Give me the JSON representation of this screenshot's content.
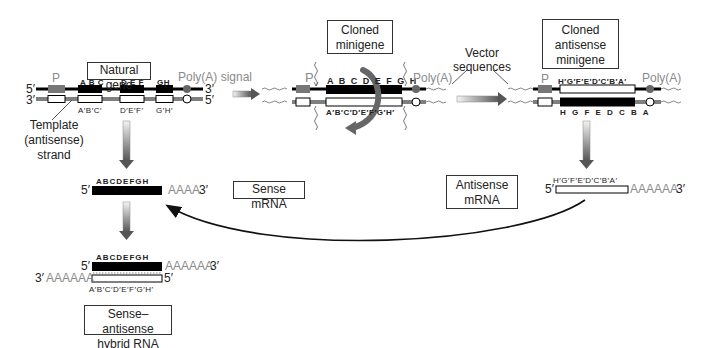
{
  "natural_gene": {
    "title": "Natural gene",
    "promoter_label": "P",
    "polya_label": "Poly(A) signal",
    "top_strand_5": "5′",
    "top_strand_3": "3′",
    "bottom_strand_3": "3′",
    "bottom_strand_5": "5′",
    "exon_labels_top": [
      "A B C",
      "D E F",
      "GH"
    ],
    "exon_labels_bottom": [
      "A′B′C′",
      "D′E′F′",
      "G′H′"
    ],
    "template_label": [
      "Template",
      "(antisense)",
      "strand"
    ]
  },
  "cloned_minigene": {
    "title": [
      "Cloned",
      "minigene"
    ],
    "promoter_label": "P",
    "polya_label": "Poly(A)",
    "top_labels": "A B C D E F G H",
    "bottom_labels": "A′B′C′D′E′F′G′H′"
  },
  "vector_sequences": {
    "label": [
      "Vector",
      "sequences"
    ]
  },
  "cloned_antisense_minigene": {
    "title": [
      "Cloned",
      "antisense",
      "minigene"
    ],
    "promoter_label": "P",
    "polya_label": "Poly(A)",
    "top_labels": "H′G′F′E′D′C′B′A′",
    "bottom_labels": "H G F E D C B A"
  },
  "sense_mrna": {
    "title": "Sense mRNA",
    "labels": "ABCDEFGH",
    "five_prime": "5′",
    "tail": "AAAA",
    "three_prime": "3′"
  },
  "antisense_mrna": {
    "title": [
      "Antisense",
      "mRNA"
    ],
    "labels": "H′G′F′E′D′C′B′A′",
    "five_prime": "5′",
    "tail": "AAAAAA",
    "three_prime": "3′"
  },
  "hybrid": {
    "title": [
      "Sense–antisense",
      "hybrid RNA"
    ],
    "top_labels": "ABCDEFGH",
    "top_five": "5′",
    "top_tail": "AAAAAA",
    "top_three": "3′",
    "bottom_three": "3′",
    "bottom_tail": "AAAAAA",
    "bottom_five": "5′",
    "bottom_labels": "A′B′C′D′E′F′G′H′"
  },
  "colors": {
    "exon": "#000000",
    "promoter": "#777777",
    "polya": "#666666",
    "arrow_gradient_start": "#f0f0f0",
    "arrow_gradient_end": "#555555",
    "tail_text": "#8a8a8a"
  }
}
